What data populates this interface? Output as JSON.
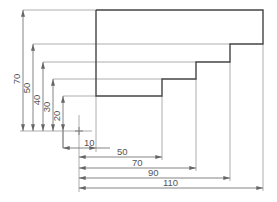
{
  "drawing": {
    "type": "ordinate dimensioned stepped profile",
    "colors": {
      "outline": "#444444",
      "dimension": "#888888",
      "text": "#555555",
      "background": "#ffffff"
    },
    "horizontal_dimensions": [
      {
        "label": "10"
      },
      {
        "label": "50"
      },
      {
        "label": "70"
      },
      {
        "label": "90"
      },
      {
        "label": "110"
      }
    ],
    "vertical_dimensions": [
      {
        "label": "70"
      },
      {
        "label": "50"
      },
      {
        "label": "40"
      },
      {
        "label": "30"
      },
      {
        "label": "20"
      }
    ]
  }
}
